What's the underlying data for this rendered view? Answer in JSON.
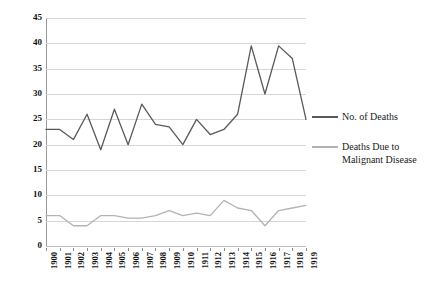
{
  "chart_data": {
    "type": "line",
    "title": "",
    "xlabel": "",
    "ylabel": "",
    "ylim": [
      0,
      45
    ],
    "ytick_step": 5,
    "yticks": [
      "45",
      "40",
      "35",
      "30",
      "25",
      "20",
      "15",
      "10",
      "5",
      "0"
    ],
    "grid": true,
    "legend_position": "right",
    "categories": [
      "1900",
      "1901",
      "1902",
      "1903",
      "1904",
      "1905",
      "1906",
      "1907",
      "1908",
      "1909",
      "1910",
      "1911",
      "1912",
      "1913",
      "1914",
      "1915",
      "1916",
      "1917",
      "1918",
      "1919"
    ],
    "series": [
      {
        "name": "No. of Deaths",
        "color": "#595959",
        "values": [
          23,
          23,
          21,
          26,
          19,
          27,
          20,
          28,
          24,
          23.5,
          20,
          25,
          22,
          23,
          26,
          39.5,
          30,
          39.5,
          37,
          25
        ]
      },
      {
        "name": "Deaths Due to Malignant Disease",
        "color": "#b3b3b3",
        "values": [
          6,
          6,
          4,
          4,
          6,
          6,
          5.5,
          5.5,
          6,
          7,
          6,
          6.5,
          6,
          9,
          7.5,
          7,
          4,
          7,
          7.5,
          8
        ]
      }
    ]
  },
  "legend": {
    "entries": [
      {
        "label": "No. of Deaths",
        "color": "#595959"
      },
      {
        "label": "Deaths Due to Malignant Disease",
        "color": "#b3b3b3"
      }
    ]
  },
  "colors": {
    "deaths_line": "#595959",
    "malignant_line": "#b3b3b3",
    "grid": "#d6d6d6",
    "axis": "#9a9a9a",
    "text": "#111111",
    "background": "#ffffff"
  }
}
